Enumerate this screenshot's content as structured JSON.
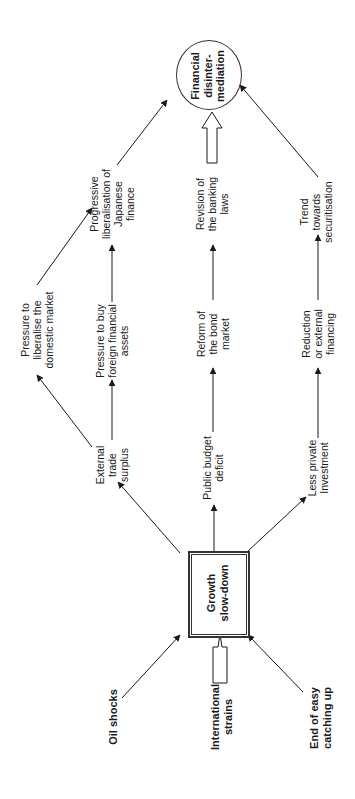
{
  "diagram": {
    "orientation": "rotated-90-ccw",
    "center_node": {
      "label_lines": [
        "Growth",
        "slow-down"
      ]
    },
    "outcome_node": {
      "label_lines": [
        "Financial",
        "disinter-",
        "mediation"
      ]
    },
    "causes": [
      {
        "id": "oil",
        "label_lines": [
          "Oil shocks"
        ]
      },
      {
        "id": "intl",
        "label_lines": [
          "International",
          "strains"
        ]
      },
      {
        "id": "end",
        "label_lines": [
          "End of easy",
          "catching up"
        ]
      }
    ],
    "branches": [
      {
        "id": "trade",
        "label_lines": [
          "External",
          "trade",
          "surplus"
        ]
      },
      {
        "id": "budget",
        "label_lines": [
          "Public budget",
          "deficit"
        ]
      },
      {
        "id": "invest",
        "label_lines": [
          "Less private",
          "Investment"
        ]
      }
    ],
    "intermediates": [
      {
        "id": "domestic",
        "label_lines": [
          "Pressure to",
          "liberalise the",
          "domestic market"
        ]
      },
      {
        "id": "foreign",
        "label_lines": [
          "Pressure to buy",
          "foreign financial",
          "assets"
        ]
      },
      {
        "id": "bond",
        "label_lines": [
          "Reform of",
          "the bond",
          "market"
        ]
      },
      {
        "id": "reduction",
        "label_lines": [
          "Reduction",
          "or external",
          "financing"
        ]
      }
    ],
    "final_steps": [
      {
        "id": "liberal",
        "label_lines": [
          "Progressive",
          "liberalisation of",
          "Japanese",
          "finance"
        ]
      },
      {
        "id": "banking",
        "label_lines": [
          "Revision of",
          "the banking",
          "laws"
        ]
      },
      {
        "id": "securit",
        "label_lines": [
          "Trend",
          "towards",
          "securitisation"
        ]
      }
    ],
    "edges": [
      [
        "oil",
        "center"
      ],
      [
        "intl",
        "center",
        "hollow"
      ],
      [
        "end",
        "center"
      ],
      [
        "center",
        "trade"
      ],
      [
        "center",
        "budget"
      ],
      [
        "center",
        "invest"
      ],
      [
        "trade",
        "domestic"
      ],
      [
        "trade",
        "foreign"
      ],
      [
        "budget",
        "bond"
      ],
      [
        "invest",
        "reduction"
      ],
      [
        "domestic",
        "liberal"
      ],
      [
        "foreign",
        "liberal"
      ],
      [
        "bond",
        "banking"
      ],
      [
        "reduction",
        "securit"
      ],
      [
        "liberal",
        "outcome"
      ],
      [
        "banking",
        "outcome",
        "hollow"
      ],
      [
        "securit",
        "outcome"
      ]
    ]
  }
}
